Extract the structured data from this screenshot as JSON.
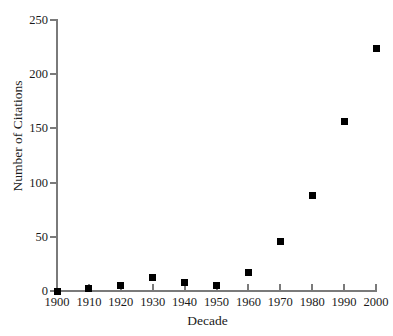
{
  "chart_data": {
    "type": "scatter",
    "title": "",
    "xlabel": "Decade",
    "ylabel": "Number of Citations",
    "x": [
      1900,
      1910,
      1920,
      1930,
      1940,
      1950,
      1960,
      1970,
      1980,
      1990,
      2000
    ],
    "values": [
      0,
      2,
      5,
      12,
      8,
      5,
      17,
      46,
      88,
      156,
      224
    ],
    "categories": [
      "1900",
      "1910",
      "1920",
      "1930",
      "1940",
      "1950",
      "1960",
      "1970",
      "1980",
      "1990",
      "2000"
    ],
    "xlim": [
      1900,
      2000
    ],
    "ylim": [
      0,
      250
    ],
    "xticks": [
      "1900",
      "1910",
      "1920",
      "1930",
      "1940",
      "1950",
      "1960",
      "1970",
      "1980",
      "1990",
      "2000"
    ],
    "yticks": [
      "0",
      "50",
      "100",
      "150",
      "200",
      "250"
    ],
    "ytick_values": [
      0,
      50,
      100,
      150,
      200,
      250
    ],
    "grid": false,
    "legend": false,
    "marker": "square",
    "marker_color": "#000000",
    "axis_color": "#7a7a7a",
    "background_color": "#ffffff"
  },
  "axis_titles": {
    "x": "Decade",
    "y": "Number of Citations"
  }
}
